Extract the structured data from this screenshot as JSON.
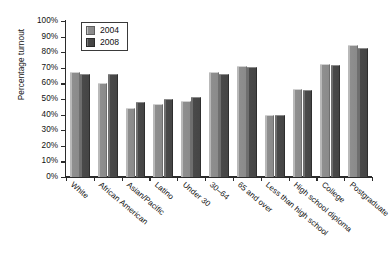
{
  "chart_data": {
    "type": "bar",
    "title": "",
    "xlabel": "",
    "ylabel": "Percentage turnout",
    "ylim": [
      0,
      100
    ],
    "ytick_labels": [
      "0%",
      "10%",
      "20%",
      "30%",
      "40%",
      "50%",
      "60%",
      "70%",
      "80%",
      "90%",
      "100%"
    ],
    "ytick_values": [
      0,
      10,
      20,
      30,
      40,
      50,
      60,
      70,
      80,
      90,
      100
    ],
    "grid": false,
    "legend_position": "upper-left-inside",
    "categories": [
      "White",
      "African American",
      "Asian/Pacific",
      "Latino",
      "Under 30",
      "30–64",
      "65 and over",
      "Less than high school",
      "High school diploma",
      "College",
      "Postgraduate"
    ],
    "series": [
      {
        "name": "2004",
        "color": "#8a8a8a",
        "values": [
          67,
          60,
          44.5,
          47,
          49,
          67,
          71,
          39.5,
          56.5,
          72.5,
          84.5
        ]
      },
      {
        "name": "2008",
        "color": "#454545",
        "values": [
          66,
          66,
          48,
          50,
          51,
          66,
          70.5,
          39.5,
          55.5,
          72,
          83
        ]
      }
    ]
  },
  "legend": {
    "entries": [
      {
        "label": "2004"
      },
      {
        "label": "2008"
      }
    ]
  }
}
